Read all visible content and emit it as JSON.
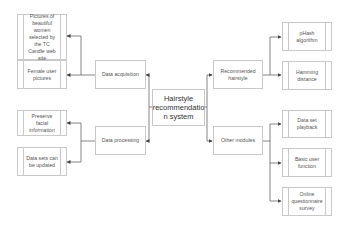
{
  "diagram": {
    "center": {
      "label": "Hairstyle recommendatio n system"
    },
    "left_branches": [
      {
        "label": "Data acquisition",
        "children": [
          {
            "label": "Pictures of beautiful women selected by the TC Candle web site"
          },
          {
            "label": "Female user pictures"
          }
        ]
      },
      {
        "label": "Data processing",
        "children": [
          {
            "label": "Preserve facial information"
          },
          {
            "label": "Data sets can be updated"
          }
        ]
      }
    ],
    "right_branches": [
      {
        "label": "Recommended hairstyle",
        "children": [
          {
            "label": "pHash algorithm"
          },
          {
            "label": "Hamming distance"
          }
        ]
      },
      {
        "label": "Other modules",
        "children": [
          {
            "label": "Data set playback"
          },
          {
            "label": "Basic user function"
          },
          {
            "label": "Online questionnaire survey"
          }
        ]
      }
    ],
    "colors": {
      "line": "#555555",
      "box_border": "#c9c9c9",
      "text": "#555555"
    }
  }
}
